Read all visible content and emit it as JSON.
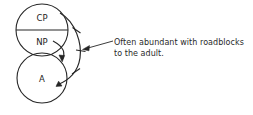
{
  "diagram": {
    "type": "ego-state-diagram",
    "stroke_color": "#262626",
    "text_color": "#2a2a2a",
    "background": "#ffffff",
    "nodes": [
      {
        "id": "cp",
        "label": "CP",
        "shape": "half-circle-top",
        "cx": 42,
        "cy": 30,
        "r": 26
      },
      {
        "id": "np",
        "label": "NP",
        "shape": "half-circle-bottom",
        "cx": 42,
        "cy": 30,
        "r": 26
      },
      {
        "id": "a",
        "label": "A",
        "shape": "circle",
        "cx": 42,
        "cy": 78,
        "r": 25
      }
    ],
    "arrows": [
      {
        "id": "outer-arc",
        "from": "cp",
        "to": "a",
        "style": "curved",
        "arrowhead": "filled",
        "tick_marks": 3
      },
      {
        "id": "inner-arc",
        "from": "np",
        "to": "a",
        "style": "curved",
        "arrowhead": "filled",
        "tick_marks": 0
      }
    ],
    "leader": {
      "id": "callout-leader",
      "arrowhead": "open",
      "points_to": "outer-arc"
    }
  },
  "annotation": {
    "line1": "Often abundant with roadblocks",
    "line2": "to the adult."
  }
}
